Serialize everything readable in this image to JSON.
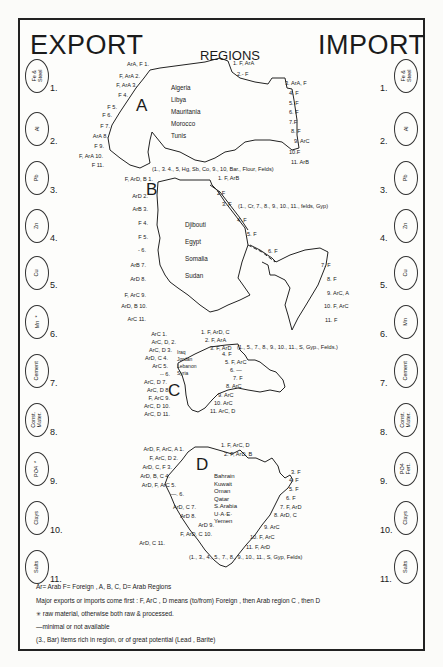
{
  "header": {
    "export_title": "EXPORT",
    "import_title": "IMPORT",
    "regions_title": "REGIONS"
  },
  "commodities": [
    {
      "n": "1.",
      "label": "Fe &\nSteel"
    },
    {
      "n": "2.",
      "label": "Al"
    },
    {
      "n": "3.",
      "label": "Pb"
    },
    {
      "n": "4.",
      "label": "Zn"
    },
    {
      "n": "5.",
      "label": "Cu"
    },
    {
      "n": "6.",
      "label": "Mn  *"
    },
    {
      "n": "7.",
      "label": "Cement"
    },
    {
      "n": "8.",
      "label": "Const.\nMater."
    },
    {
      "n": "9.",
      "label": "PO4  *"
    },
    {
      "n": "10.",
      "label": "Clays"
    },
    {
      "n": "11.",
      "label": "Salts"
    }
  ],
  "import_commodities": [
    {
      "n": "1.",
      "label": "Fe &\nSteel"
    },
    {
      "n": "2.",
      "label": "Al"
    },
    {
      "n": "3.",
      "label": "Pb"
    },
    {
      "n": "4.",
      "label": "Zn"
    },
    {
      "n": "5.",
      "label": "Cu"
    },
    {
      "n": "6.",
      "label": "Mn"
    },
    {
      "n": "7.",
      "label": "Cement"
    },
    {
      "n": "8.",
      "label": "Const.\nMater."
    },
    {
      "n": "9.",
      "label": "PO4\nFert."
    },
    {
      "n": "10.",
      "label": "Clays"
    },
    {
      "n": "11.",
      "label": "Salts"
    }
  ],
  "regions": {
    "A": {
      "letter": "A",
      "countries": [
        "Algeria",
        "Libya",
        "Mauritania",
        "Morocco",
        "Tunis"
      ],
      "export": [
        "ArA, F 1.",
        "F, ArA 2.",
        "F, ArA 3.",
        "F 4.",
        "F 5.",
        "F 6.",
        "F 7.",
        "ArA 8.",
        "F 9.",
        "F, ArA 10.",
        "F 11."
      ],
      "import": [
        "1. F, ArA",
        "2.- F",
        "3. ArA, F",
        "4. F",
        "5. F",
        "6. F",
        "7.F",
        "8. F",
        "9. ArC",
        "10.F",
        "11. ArB"
      ],
      "rich": "(1., 3. 4., 5, Hg, Sb, Co, 9., 10, Bar., Flour, Felds)"
    },
    "B": {
      "letter": "B",
      "countries": [
        "Djibouti",
        "Egypt",
        "Somalia",
        "Sudan"
      ],
      "export": [
        "F, ArD, B 1.",
        "ArD 2.",
        "ArB 3.",
        "F 4.",
        "F 5.",
        "- 6.",
        "ArB 7.",
        "ArD 8.",
        "F, ArC 9.",
        "ArD, B 10.",
        "ArC 11."
      ],
      "import": [
        "1. F, ArB",
        "2.F",
        "3. F",
        "4. F",
        "5. F",
        "6. F",
        "7. F",
        "8. F",
        "9. ArC, A",
        "10. F, ArC",
        "11. F"
      ],
      "rich": "(1., Cr, 7., 8., 9., 10., 11., felds, Gyp)"
    },
    "C": {
      "letter": "C",
      "countries": [
        "Iraq",
        "Jordan",
        "Lebanon",
        "Syria"
      ],
      "export": [
        "ArC 1.",
        "ArC, D, 2.",
        "ArC, D 3.",
        "ArD, C 4.",
        "ArC 5.",
        "-- 6.",
        "ArC, D 7.",
        "ArC, D 8.",
        "F, ArC 9.",
        "ArC, D 10.",
        "ArC, D 11."
      ],
      "import": [
        "1. F, ArD, C",
        "2. F, ArA",
        "3. F, ArD",
        "4. F",
        "5. F, ArC",
        "6. —",
        "7. F",
        "8. ArC",
        "9. ArC",
        "10. ArC",
        "11. ArC, D"
      ],
      "rich": "(1., 5., 7., 8., 9., 10., 11., S, Gyp., Felds.)"
    },
    "D": {
      "letter": "D",
      "countries": [
        "Bahrain",
        "Kuwait",
        "Oman",
        "Qatar",
        "S.Arabia",
        "U·A·E·",
        "Yemen"
      ],
      "export": [
        "ArD, F, ArC, A 1.",
        "F, ArC, D 2.",
        "ArD, C, F 3.",
        "ArD, B, C 4.",
        "ArD, F, ArC 5.",
        "—. 6.",
        "ArD, C 7.",
        "ArD 8.",
        "ArD 9.",
        "F, ArD, C 10.",
        "ArD, C 11."
      ],
      "import": [
        "1. F, ArC, D",
        "2. F, ArD, B",
        "3. F",
        "4. F",
        "5. F",
        "6. F",
        "7. F, ArD",
        "8. ArD, C",
        "9. ArC",
        "10. F, ArC",
        "11. F, ArD"
      ],
      "rich": "(1., 3., 4., 5., 7., 8., 9., 10., 11., S, Gyp, Felds)"
    }
  },
  "legend": {
    "line1": "Ar= Arab   F= Foreign ,   A, B, C, D= Arab  Regions",
    "line2": "Major exports or imports come first : F, ArC , D means (to/from) Foreign , then  Arab region C , then D",
    "line3": "✳ raw material, otherwise both raw & processed.",
    "line4": "—minimal  or not  available",
    "line5": "(3., Bar)  items  rich in  region, or of  great potential (Lead ,  Barite)"
  }
}
